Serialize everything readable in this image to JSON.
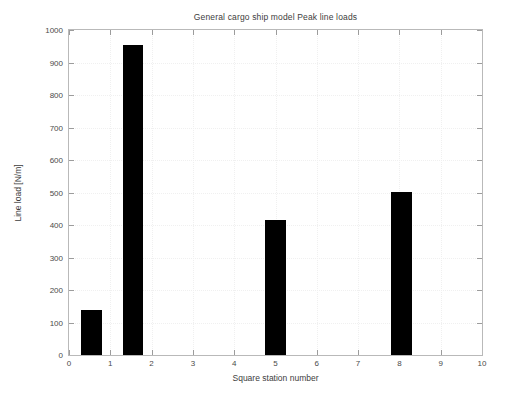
{
  "chart_data": {
    "type": "bar",
    "title": "General cargo ship model Peak line loads",
    "xlabel": "Square station number",
    "ylabel": "Line load [N/m]",
    "xlim": [
      0,
      10
    ],
    "ylim": [
      0,
      1000
    ],
    "xticks": [
      0,
      1,
      2,
      3,
      4,
      5,
      6,
      7,
      8,
      9,
      10
    ],
    "yticks": [
      0,
      100,
      200,
      300,
      400,
      500,
      600,
      700,
      800,
      900,
      1000
    ],
    "xtick_labels": [
      "0",
      "1",
      "2",
      "3",
      "4",
      "5",
      "6",
      "7",
      "8",
      "9",
      "10"
    ],
    "ytick_labels": [
      "0",
      "100",
      "200",
      "300",
      "400",
      "500",
      "600",
      "700",
      "800",
      "900",
      "1000"
    ],
    "grid": true,
    "legend": false,
    "bar_color": "#000000",
    "bar_width": 0.5,
    "x": [
      0.55,
      1.55,
      5.0,
      8.05
    ],
    "values": [
      140,
      955,
      415,
      503
    ],
    "bars": [
      {
        "label": "station 0.55",
        "x": 0.55,
        "value": 140
      },
      {
        "label": "station 1.55",
        "x": 1.55,
        "value": 955
      },
      {
        "label": "station 5",
        "x": 5.0,
        "value": 415
      },
      {
        "label": "station 8",
        "x": 8.05,
        "value": 503
      }
    ]
  },
  "figure": {
    "background_color": "#ffffff",
    "axes_border_color": "#b9b9b9",
    "grid_color": "#f0f0f0",
    "text_color": "#4a4a4a"
  }
}
